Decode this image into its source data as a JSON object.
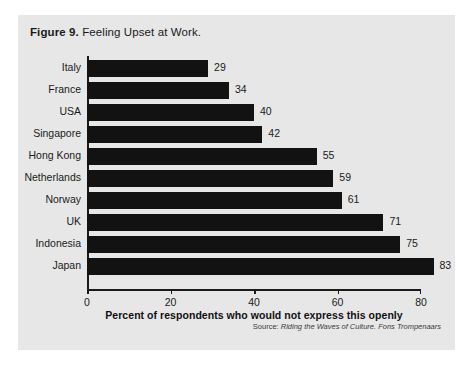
{
  "figure": {
    "number_label": "Figure 9.",
    "title": "Feeling Upset at Work.",
    "panel_color": "#e7e7e7",
    "bar_color": "#121212",
    "source_label": "Source:",
    "source_text": "Riding the Waves of Culture. Fons Trompenaars"
  },
  "chart_data": {
    "type": "bar",
    "orientation": "horizontal",
    "title": "Figure 9. Feeling Upset at Work.",
    "categories": [
      "Italy",
      "France",
      "USA",
      "Singapore",
      "Hong Kong",
      "Netherlands",
      "Norway",
      "UK",
      "Indonesia",
      "Japan"
    ],
    "values": [
      29,
      34,
      40,
      42,
      55,
      59,
      61,
      71,
      75,
      83
    ],
    "value_labels": [
      "29",
      "34",
      "40",
      "42",
      "55",
      "59",
      "61",
      "71",
      "75",
      "83"
    ],
    "xlabel": "Percent of respondents who would not express this openly",
    "ylabel": "",
    "xlim": [
      0,
      80
    ],
    "xticks": [
      0,
      20,
      40,
      60,
      80
    ],
    "xtick_labels": [
      "0",
      "20",
      "40",
      "60",
      "80"
    ],
    "grid": false,
    "legend": false,
    "source": "Source: Riding the Waves of Culture. Fons Trompenaars"
  }
}
